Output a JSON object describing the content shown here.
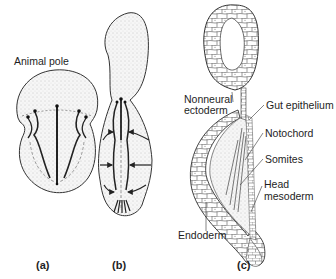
{
  "figure": {
    "panels": [
      {
        "id": "a",
        "caption": "(a)"
      },
      {
        "id": "b",
        "caption": "(b)"
      },
      {
        "id": "c",
        "caption": "(c)"
      }
    ],
    "labels": {
      "animal_pole": "Animal pole",
      "nonneural_ectoderm_1": "Nonneural",
      "nonneural_ectoderm_2": "ectoderm",
      "gut_epithelium": "Gut epithelium",
      "notochord": "Notochord",
      "somites": "Somites",
      "head_mesoderm_1": "Head",
      "head_mesoderm_2": "mesoderm",
      "endoderm": "Endoderm"
    },
    "colors": {
      "outline": "#333333",
      "stipple": "#c8c8c8",
      "background": "#ffffff"
    }
  }
}
